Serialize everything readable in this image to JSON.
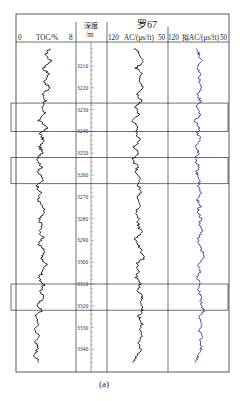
{
  "chart_data": {
    "type": "line",
    "title": "罗67",
    "caption": "(a)",
    "layout": {
      "frame": {
        "x0": 16,
        "x1": 229,
        "y_top": 14,
        "y_header_bottom": 42,
        "y_bottom": 372
      },
      "dividers_x": [
        76,
        107,
        168
      ],
      "depth_axis_x": 91,
      "px_per_m": 2.18,
      "depth_ref": {
        "depth": 3210,
        "y": 66
      }
    },
    "tracks": [
      {
        "name": "TOC",
        "label": "TOC/%",
        "scale_left": "0",
        "scale_right": "8",
        "min": 0,
        "max": 8,
        "color": "#111111",
        "x0": 16,
        "x1": 76
      },
      {
        "name": "depth",
        "label_top": "深度",
        "label_bottom": "/m",
        "x0": 76,
        "x1": 107
      },
      {
        "name": "AC",
        "label": "AC/(μs/ft)",
        "scale_left": "120",
        "scale_right": "50",
        "min": 120,
        "max": 50,
        "color": "#111111",
        "x0": 107,
        "x1": 168
      },
      {
        "name": "simAC",
        "label": "拟AC/(μs/ft)",
        "scale_left": "120",
        "scale_right": "50",
        "min": 120,
        "max": 50,
        "color": "#2a3f8f",
        "x0": 168,
        "x1": 229
      }
    ],
    "depth_ticks": [
      3210,
      3220,
      3230,
      3240,
      3250,
      3260,
      3270,
      3280,
      3290,
      3300,
      3310,
      3320,
      3330,
      3340
    ],
    "depth_range": [
      3201,
      3348
    ],
    "highlight_intervals": [
      {
        "top": 3227,
        "bottom": 3240
      },
      {
        "top": 3252,
        "bottom": 3264
      },
      {
        "top": 3310,
        "bottom": 3322
      }
    ],
    "series": [
      {
        "name": "TOC/%",
        "unit": "%",
        "depth_step_m": 3,
        "depths": [
          3202,
          3205,
          3208,
          3211,
          3214,
          3217,
          3220,
          3223,
          3226,
          3229,
          3232,
          3235,
          3238,
          3241,
          3244,
          3247,
          3250,
          3253,
          3256,
          3259,
          3262,
          3265,
          3268,
          3271,
          3274,
          3277,
          3280,
          3283,
          3286,
          3289,
          3292,
          3295,
          3298,
          3301,
          3304,
          3307,
          3310,
          3313,
          3316,
          3319,
          3322,
          3325,
          3328,
          3331,
          3334,
          3337,
          3340,
          3343,
          3346
        ],
        "values": [
          4.4,
          4.0,
          4.7,
          3.6,
          4.4,
          3.8,
          4.5,
          3.5,
          4.0,
          3.3,
          3.8,
          3.0,
          4.2,
          3.2,
          3.7,
          3.1,
          3.5,
          2.9,
          3.4,
          3.0,
          3.6,
          2.8,
          3.3,
          2.9,
          3.4,
          3.8,
          3.0,
          3.5,
          3.1,
          3.6,
          3.0,
          3.9,
          3.3,
          4.1,
          3.6,
          3.0,
          3.7,
          3.2,
          3.8,
          2.8,
          3.4,
          2.6,
          3.0,
          2.5,
          3.1,
          2.6,
          2.9,
          2.5,
          3.0
        ]
      },
      {
        "name": "AC/(μs/ft)",
        "unit": "μs/ft",
        "depth_step_m": 3,
        "depths": [
          3202,
          3205,
          3208,
          3211,
          3214,
          3217,
          3220,
          3223,
          3226,
          3229,
          3232,
          3235,
          3238,
          3241,
          3244,
          3247,
          3250,
          3253,
          3256,
          3259,
          3262,
          3265,
          3268,
          3271,
          3274,
          3277,
          3280,
          3283,
          3286,
          3289,
          3292,
          3295,
          3298,
          3301,
          3304,
          3307,
          3310,
          3313,
          3316,
          3319,
          3322,
          3325,
          3328,
          3331,
          3334,
          3337,
          3340,
          3343,
          3346
        ],
        "values": [
          88,
          82,
          79,
          87,
          80,
          84,
          78,
          86,
          81,
          88,
          83,
          90,
          85,
          87,
          82,
          89,
          84,
          91,
          85,
          88,
          82,
          84,
          80,
          86,
          82,
          87,
          83,
          85,
          80,
          88,
          84,
          81,
          78,
          86,
          83,
          87,
          82,
          85,
          80,
          82,
          78,
          84,
          80,
          83,
          79,
          84,
          81,
          86,
          90
        ]
      },
      {
        "name": "拟AC/(μs/ft)",
        "unit": "μs/ft",
        "depth_step_m": 3,
        "depths": [
          3202,
          3205,
          3208,
          3211,
          3214,
          3217,
          3220,
          3223,
          3226,
          3229,
          3232,
          3235,
          3238,
          3241,
          3244,
          3247,
          3250,
          3253,
          3256,
          3259,
          3262,
          3265,
          3268,
          3271,
          3274,
          3277,
          3280,
          3283,
          3286,
          3289,
          3292,
          3295,
          3298,
          3301,
          3304,
          3307,
          3310,
          3313,
          3316,
          3319,
          3322,
          3325,
          3328,
          3331,
          3334,
          3337,
          3340,
          3343,
          3346
        ],
        "values": [
          86,
          84,
          82,
          86,
          83,
          85,
          81,
          86,
          82,
          87,
          83,
          89,
          85,
          86,
          83,
          88,
          84,
          89,
          85,
          87,
          83,
          85,
          82,
          86,
          83,
          86,
          82,
          84,
          80,
          86,
          84,
          81,
          78,
          86,
          83,
          87,
          83,
          85,
          81,
          83,
          79,
          84,
          81,
          84,
          80,
          84,
          82,
          86,
          88
        ]
      }
    ],
    "xlabel": "",
    "ylabel": "深度/m",
    "grid": false,
    "legend": "track headers"
  }
}
